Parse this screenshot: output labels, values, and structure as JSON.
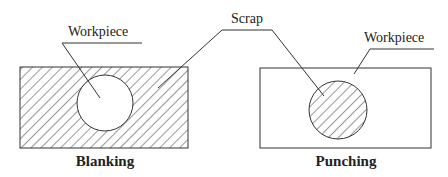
{
  "labels": {
    "workpiece_left": "Workpiece",
    "workpiece_right": "Workpiece",
    "scrap": "Scrap"
  },
  "captions": {
    "left": "Blanking",
    "right": "Punching"
  },
  "colors": {
    "line": "#333333",
    "text": "#222222",
    "background": "#ffffff"
  }
}
